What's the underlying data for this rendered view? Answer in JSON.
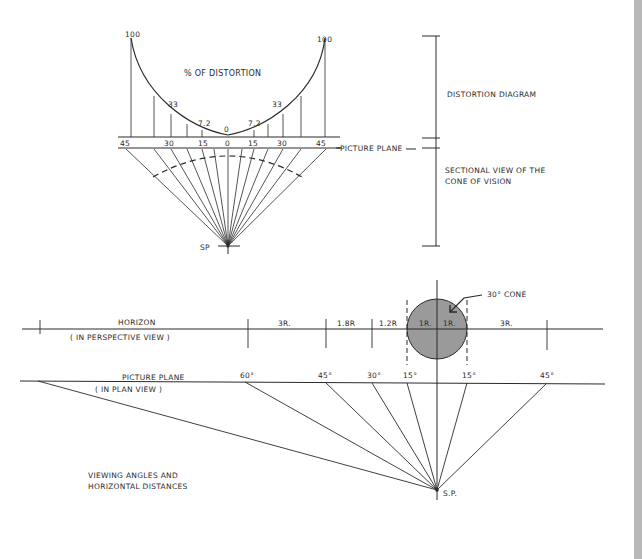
{
  "colors": {
    "ink": "#2a2a2a",
    "cone_fill": "#9a9a9a",
    "edge_strip": "#b8b8b8"
  },
  "distortion_diagram": {
    "title": "% OF DISTORTION",
    "section_label": "DISTORTION DIAGRAM",
    "picture_plane_label": "PICTURE PLANE",
    "station_point_label": "SP",
    "cone_section_label_line1": "SECTIONAL VIEW OF THE",
    "cone_section_label_line2": "CONE OF VISION",
    "curve_values": [
      {
        "angle": -45,
        "label": "100",
        "value": 100
      },
      {
        "angle": -30,
        "label": "33",
        "value": 33
      },
      {
        "angle": -15,
        "label": "7.2",
        "value": 7.2
      },
      {
        "angle": 0,
        "label": "0",
        "value": 0
      },
      {
        "angle": 15,
        "label": "7.2",
        "value": 7.2
      },
      {
        "angle": 30,
        "label": "33",
        "value": 33
      },
      {
        "angle": 45,
        "label": "100",
        "value": 100
      }
    ],
    "angle_labels": [
      "45",
      "30",
      "15",
      "0",
      "15",
      "30",
      "45"
    ]
  },
  "horizontal_distances": {
    "horizon_label": "HORIZON",
    "horizon_sublabel": "( IN PERSPECTIVE VIEW )",
    "picture_plane_label": "PICTURE PLANE",
    "picture_plane_sublabel": "( IN PLAN VIEW )",
    "cone_label": "30° CONE",
    "segments": [
      "3R.",
      "1.8R",
      "1.2R",
      "1R.",
      "1R.",
      "3R."
    ],
    "viewing_angles": [
      "60°",
      "45°",
      "30°",
      "15°",
      "15°",
      "45°"
    ],
    "station_point_label": "S.P.",
    "caption_line1": "VIEWING ANGLES AND",
    "caption_line2": "HORIZONTAL DISTANCES"
  }
}
